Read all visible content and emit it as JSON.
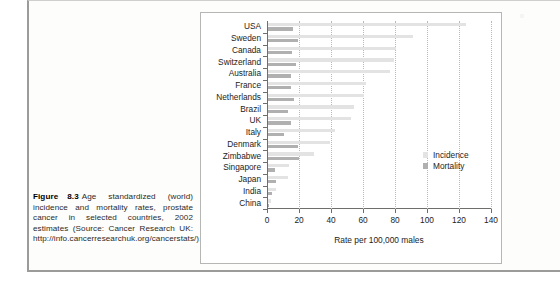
{
  "caption": {
    "figure_word": "Figure",
    "figure_number": "8.3",
    "text": "Age standardized (world) incidence and mortality rates, prostate cancer in selected countries, 2002 estimates (Source: Cancer Research UK: http://info.cancerresearchuk.org/cancerstats/)."
  },
  "legend": {
    "position": "inside-right",
    "items": [
      {
        "label": "Incidence",
        "color": "#e3e3e3"
      },
      {
        "label": "Mortality",
        "color": "#b0b0b0"
      }
    ]
  },
  "chart_data": {
    "type": "bar",
    "orientation": "horizontal",
    "title": "",
    "subtitle": "",
    "xlabel": "Rate per 100,000 males",
    "ylabel": "",
    "xlim": [
      0,
      140
    ],
    "xticks": [
      0,
      20,
      40,
      60,
      80,
      100,
      120,
      140
    ],
    "xticklabels": [
      "0",
      "20",
      "40",
      "60",
      "80",
      "100",
      "120",
      "140"
    ],
    "grid": "vertical-dotted",
    "categories": [
      "USA",
      "Sweden",
      "Canada",
      "Switzerland",
      "Australia",
      "France",
      "Netherlands",
      "Brazil",
      "UK",
      "Italy",
      "Denmark",
      "Zimbabwe",
      "Singapore",
      "Japan",
      "India",
      "China"
    ],
    "series": [
      {
        "name": "Incidence",
        "color": "#e3e3e3",
        "values": [
          124.0,
          90.9,
          80.0,
          79.0,
          76.0,
          61.0,
          60.0,
          54.0,
          52.0,
          42.0,
          39.0,
          29.0,
          13.0,
          12.6,
          5.0,
          1.6
        ]
      },
      {
        "name": "Mortality",
        "color": "#b0b0b0",
        "values": [
          15.8,
          18.7,
          15.0,
          17.5,
          14.5,
          14.5,
          16.0,
          12.5,
          14.5,
          10.0,
          18.5,
          19.5,
          4.5,
          5.3,
          2.5,
          0.8
        ]
      }
    ]
  }
}
